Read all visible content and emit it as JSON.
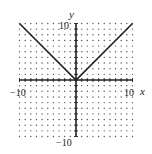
{
  "chart_data": {
    "type": "line",
    "title": "",
    "function": "y = |x|",
    "xlabel": "x",
    "ylabel": "y",
    "xlim": [
      -10,
      10
    ],
    "ylim": [
      -10,
      10
    ],
    "grid": "dotted",
    "grid_step": 1,
    "tick_labels": {
      "x_min": "−10",
      "x_max": "10",
      "y_max": "10",
      "y_min": "−10"
    },
    "series": [
      {
        "name": "y = |x|",
        "x": [
          -10,
          0,
          10
        ],
        "y": [
          10,
          0,
          10
        ]
      }
    ]
  },
  "colors": {
    "line": "#222222",
    "grid": "#555555",
    "axis": "#222222"
  }
}
